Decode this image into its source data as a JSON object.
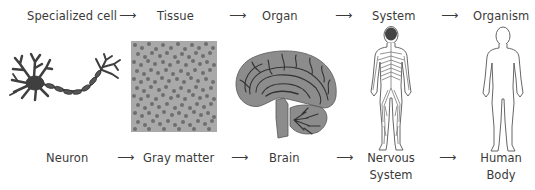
{
  "top_row": {
    "levels": [
      {
        "label": "Specialized cell"
      },
      {
        "label": "Tissue"
      },
      {
        "label": "Organ"
      },
      {
        "label": "System"
      },
      {
        "label": "Organism"
      }
    ],
    "arrow": "⟶"
  },
  "bottom_row": {
    "examples": [
      {
        "label": "Neuron"
      },
      {
        "label": "Gray matter"
      },
      {
        "label": "Brain"
      },
      {
        "label_line1": "Nervous",
        "label_line2": "System"
      },
      {
        "label_line1": "Human",
        "label_line2": "Body"
      }
    ],
    "arrow": "⟶"
  },
  "illustrations": [
    {
      "name": "neuron-illustration",
      "depicts": "neuron"
    },
    {
      "name": "gray-matter-illustration",
      "depicts": "gray matter tissue"
    },
    {
      "name": "brain-illustration",
      "depicts": "brain sagittal section"
    },
    {
      "name": "nervous-system-illustration",
      "depicts": "nervous system on human figure"
    },
    {
      "name": "human-body-illustration",
      "depicts": "human body outline"
    }
  ],
  "colors": {
    "text": "#3a3a3a",
    "neuron": "#3f3f3f",
    "gray_matter_bg": "#a9a9a9",
    "gray_matter_cells": "#6e6e6e",
    "brain_fill": "#8c8c8c",
    "brain_lines": "#333333",
    "outline": "#555555"
  }
}
